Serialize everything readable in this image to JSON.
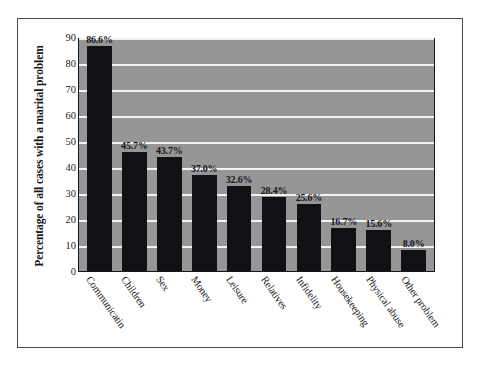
{
  "chart_data": {
    "type": "bar",
    "title": "",
    "xlabel": "",
    "ylabel": "Percentage of all cases with a marital problem",
    "ylim": [
      0,
      90
    ],
    "yticks": [
      0,
      10,
      20,
      30,
      40,
      50,
      60,
      70,
      80,
      90
    ],
    "ytick_labels": [
      "0",
      "10",
      "20",
      "30",
      "40",
      "50",
      "60",
      "70",
      "80",
      "90"
    ],
    "grid": true,
    "legend": "none",
    "categories": [
      "Communicatin",
      "Children",
      "Sex",
      "Money",
      "Leisure",
      "Relatives",
      "Infidelity",
      "Housekeeping",
      "Physical abuse",
      "Other problem"
    ],
    "values": [
      86.6,
      45.7,
      43.7,
      37.0,
      32.6,
      28.4,
      25.6,
      16.7,
      15.6,
      8.0
    ],
    "value_labels": [
      "86.6%",
      "45.7%",
      "43.7%",
      "37.0%",
      "32.6%",
      "28.4%",
      "25.6%",
      "16.7%",
      "15.6%",
      "8.0%"
    ],
    "colors": {
      "bar": "#111115",
      "plot_background": "#969696",
      "gridline": "#f2f2f2",
      "plot_border": "#15151a",
      "page_frame": "#4a4a52",
      "text": "#1a1a1a"
    }
  }
}
